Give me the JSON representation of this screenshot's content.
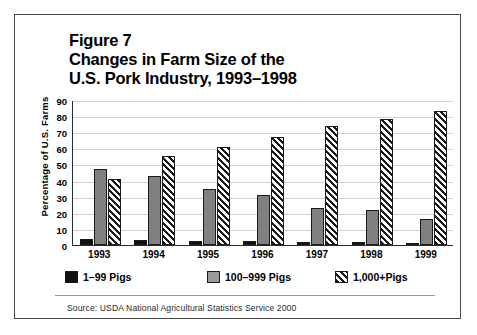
{
  "figure": {
    "title_lines": [
      "Figure 7",
      "Changes in Farm Size of the",
      "U.S. Pork Industry, 1993–1998"
    ],
    "source": "Source: USDA National Agricultural Statistics Service 2000"
  },
  "chart_data": {
    "type": "bar",
    "title": "Figure 7 Changes in Farm Size of the U.S. Pork Industry, 1993–1998",
    "xlabel": "",
    "ylabel": "Percentage of U.S. Farms",
    "categories": [
      "1993",
      "1994",
      "1995",
      "1996",
      "1997",
      "1998",
      "1999"
    ],
    "series": [
      {
        "name": "1–99 Pigs",
        "color": "#111111",
        "pattern": "solid-black",
        "values": [
          4,
          3,
          2.5,
          2.5,
          2,
          2,
          1.5
        ]
      },
      {
        "name": "100–999 Pigs",
        "color": "#808080",
        "pattern": "solid-gray",
        "values": [
          47,
          43,
          35,
          31,
          23,
          22,
          16
        ]
      },
      {
        "name": "1,000+Pigs",
        "color": "#ffffff",
        "pattern": "diagonal-hatch",
        "values": [
          41,
          55,
          61,
          67,
          74,
          78,
          83
        ]
      }
    ],
    "ylim": [
      0,
      90
    ],
    "yticks": [
      0,
      10,
      20,
      30,
      40,
      50,
      60,
      70,
      80,
      90
    ],
    "grid": true,
    "legend_position": "bottom"
  }
}
